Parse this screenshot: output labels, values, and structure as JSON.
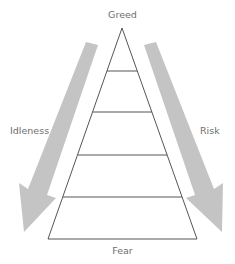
{
  "diagram": {
    "type": "pyramid-with-arrows",
    "top_label": "Greed",
    "bottom_label": "Fear",
    "left_arrow_label": "Idleness",
    "right_arrow_label": "Risk",
    "pyramid_levels": 5,
    "colors": {
      "line": "#555555",
      "arrow": "#c4c4c4",
      "text": "#6e6e6e",
      "background": "#ffffff"
    }
  }
}
